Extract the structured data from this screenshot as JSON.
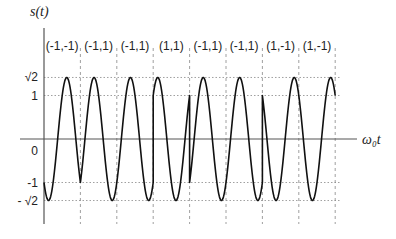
{
  "diagram": {
    "y_axis_label": "s(t)",
    "x_axis_label": "ω₀t",
    "y_ticks": [
      {
        "label": "√2",
        "value": 1.4142
      },
      {
        "label": "1",
        "value": 1
      },
      {
        "label": "0",
        "value": 0
      },
      {
        "label": "-1",
        "value": -1
      },
      {
        "label": "- √2",
        "value": -1.4142
      }
    ],
    "symbols": [
      {
        "label": "(-1,-1)",
        "a": -1,
        "b": -1
      },
      {
        "label": "(-1,1)",
        "a": -1,
        "b": 1
      },
      {
        "label": "(-1,1)",
        "a": -1,
        "b": 1
      },
      {
        "label": "(1,1)",
        "a": 1,
        "b": 1
      },
      {
        "label": "(-1,1)",
        "a": -1,
        "b": 1
      },
      {
        "label": "(-1,1)",
        "a": -1,
        "b": 1
      },
      {
        "label": "(1,-1)",
        "a": 1,
        "b": -1
      },
      {
        "label": "(1,-1)",
        "a": 1,
        "b": -1
      }
    ],
    "waveform": "s(t) = a·cos(ω₀t) + b·sin(ω₀t), one carrier cycle per symbol",
    "colors": {
      "curve": "#111111",
      "axis": "#555555",
      "grid": "#888888"
    }
  },
  "geometry": {
    "axis_x": 44,
    "zero_y": 139,
    "unit_px": 43.5,
    "symbol_start_x": 44,
    "symbol_width": 36.4,
    "x_axis_end": 357,
    "y_axis_top": 28,
    "y_axis_bottom": 224
  }
}
